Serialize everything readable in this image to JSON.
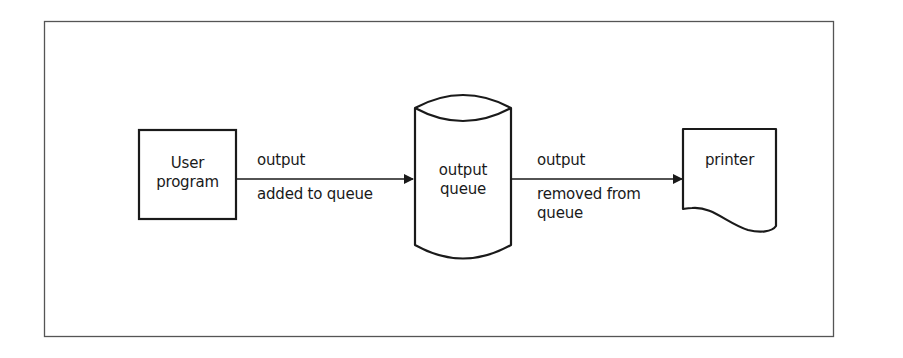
{
  "diagram": {
    "type": "flowchart",
    "title": "",
    "nodes": [
      {
        "id": "user_program",
        "shape": "rectangle",
        "lines": [
          "User",
          "program"
        ]
      },
      {
        "id": "output_queue",
        "shape": "cylinder",
        "lines": [
          "output",
          "queue"
        ]
      },
      {
        "id": "printer",
        "shape": "document",
        "lines": [
          "printer"
        ]
      }
    ],
    "edges": [
      {
        "from": "user_program",
        "to": "output_queue",
        "label_above": "output",
        "label_below": [
          "added to queue"
        ]
      },
      {
        "from": "output_queue",
        "to": "printer",
        "label_above": "output",
        "label_below": [
          "removed from",
          "queue"
        ]
      }
    ],
    "colors": {
      "stroke": "#1a1a1a",
      "frame": "#555555",
      "background": "#ffffff"
    }
  }
}
